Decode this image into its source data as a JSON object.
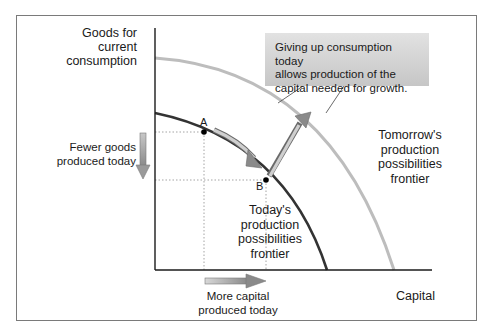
{
  "diagram": {
    "axes": {
      "y_label": "Goods for current consumption",
      "y_label_lines": [
        "Goods for",
        "current",
        "consumption"
      ],
      "x_label": "Capital"
    },
    "curves": [
      {
        "name": "Today's production possibilities frontier",
        "label_lines": [
          "Today's",
          "production",
          "possibilities",
          "frontier"
        ],
        "color": "#333333"
      },
      {
        "name": "Tomorrow's production possibilities frontier",
        "label_lines": [
          "Tomorrow's",
          "production",
          "possibilities",
          "frontier"
        ],
        "color": "#bdbdbd"
      }
    ],
    "points": [
      {
        "id": "A",
        "label": "A",
        "curve": "today"
      },
      {
        "id": "B",
        "label": "B",
        "curve": "today"
      }
    ],
    "annotations": {
      "fewer_goods": {
        "lines": [
          "Fewer goods",
          "produced today"
        ],
        "arrow": "down"
      },
      "more_capital": {
        "lines": [
          "More capital",
          "produced today"
        ],
        "arrow": "right"
      },
      "callout": {
        "lines": [
          "Giving up consumption today",
          "allows production of the",
          "capital needed for growth."
        ]
      }
    },
    "colors": {
      "frame": "#7a7a7a",
      "axis": "#1a1a1a",
      "today_curve": "#333333",
      "tomorrow_curve": "#bdbdbd",
      "arrow_fill": "#9a9a9a",
      "callout_bg": "#d4d4d4",
      "dotted_guides": "#9a9a9a"
    }
  }
}
